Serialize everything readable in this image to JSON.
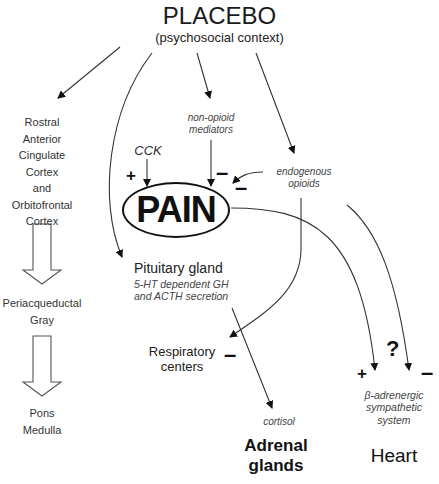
{
  "header": {
    "title": "PLACEBO",
    "subtitle": "(psychosocial context)"
  },
  "left_column": {
    "cortex_lines": [
      "Rostral",
      "Anterior",
      "Cingulate",
      "Cortex",
      "and",
      "Orbitofrontal",
      "Cortex"
    ],
    "pag_lines": [
      "Periacqueductal",
      "Gray"
    ],
    "pons_lines": [
      "Pons",
      "Medulla"
    ]
  },
  "center": {
    "cck": "CCK",
    "cck_sign": "+",
    "non_opioid_lines": [
      "non-opioid",
      "mediators"
    ],
    "non_opioid_sign": "–",
    "endogenous_lines": [
      "endogenous",
      "opioids"
    ],
    "endogenous_sign": "–",
    "pain": "PAIN"
  },
  "pituitary": {
    "title": "Pituitary gland",
    "detail_lines": [
      "5-HT dependent GH",
      "and ACTH secretion"
    ]
  },
  "respiratory": {
    "lines": [
      "Respiratory",
      "centers"
    ],
    "sign": "–"
  },
  "adrenal": {
    "hormone": "cortisol",
    "lines": [
      "Adrenal",
      "glands"
    ]
  },
  "heart": {
    "plus_sign": "+",
    "question": "?",
    "minus_sign": "–",
    "system_lines": [
      "β-adrenergic",
      "sympathetic",
      "system"
    ],
    "label": "Heart"
  },
  "colors": {
    "line": "#333333",
    "text": "#222222",
    "background": "#ffffff"
  }
}
